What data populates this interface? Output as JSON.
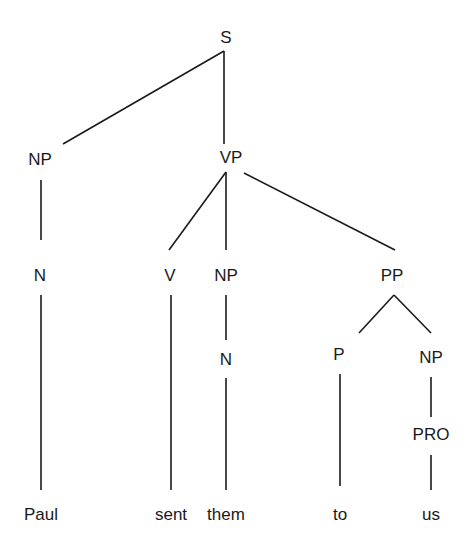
{
  "diagram": {
    "type": "syntax-tree",
    "sentence": "Paul sent them to us",
    "nodes": {
      "s": {
        "label": "S",
        "x": 226,
        "y": 38
      },
      "np_subj": {
        "label": "NP",
        "x": 40,
        "y": 160
      },
      "vp": {
        "label": "VP",
        "x": 231,
        "y": 158
      },
      "n_subj": {
        "label": "N",
        "x": 40,
        "y": 276
      },
      "v": {
        "label": "V",
        "x": 170,
        "y": 276
      },
      "np_obj": {
        "label": "NP",
        "x": 226,
        "y": 276
      },
      "pp": {
        "label": "PP",
        "x": 392,
        "y": 276
      },
      "n_obj": {
        "label": "N",
        "x": 226,
        "y": 360
      },
      "p": {
        "label": "P",
        "x": 339,
        "y": 355
      },
      "np_pp": {
        "label": "NP",
        "x": 431,
        "y": 358
      },
      "pro": {
        "label": "PRO",
        "x": 431,
        "y": 435
      }
    },
    "leaves": [
      {
        "id": "paul",
        "label": "Paul",
        "x": 41,
        "y": 515
      },
      {
        "id": "sent",
        "label": "sent",
        "x": 171,
        "y": 515
      },
      {
        "id": "them",
        "label": "them",
        "x": 226,
        "y": 515
      },
      {
        "id": "to",
        "label": "to",
        "x": 340,
        "y": 515
      },
      {
        "id": "us",
        "label": "us",
        "x": 431,
        "y": 515
      }
    ],
    "edges": [
      {
        "from": "S",
        "to": "NP",
        "x1": 224,
        "y1": 51,
        "x2": 63,
        "y2": 144
      },
      {
        "from": "S",
        "to": "VP",
        "x1": 224,
        "y1": 51,
        "x2": 224,
        "y2": 144
      },
      {
        "from": "NP",
        "to": "N",
        "x1": 41,
        "y1": 180,
        "x2": 41,
        "y2": 240
      },
      {
        "from": "VP",
        "to": "V",
        "x1": 226,
        "y1": 172,
        "x2": 169,
        "y2": 250
      },
      {
        "from": "VP",
        "to": "NP",
        "x1": 226,
        "y1": 172,
        "x2": 226,
        "y2": 250
      },
      {
        "from": "VP",
        "to": "PP",
        "x1": 244,
        "y1": 173,
        "x2": 395,
        "y2": 250
      },
      {
        "from": "N",
        "to": "Paul",
        "x1": 41,
        "y1": 295,
        "x2": 41,
        "y2": 490
      },
      {
        "from": "V",
        "to": "sent",
        "x1": 171,
        "y1": 295,
        "x2": 171,
        "y2": 490
      },
      {
        "from": "NP",
        "to": "N",
        "x1": 226,
        "y1": 295,
        "x2": 226,
        "y2": 340
      },
      {
        "from": "N",
        "to": "them",
        "x1": 226,
        "y1": 378,
        "x2": 226,
        "y2": 490
      },
      {
        "from": "PP",
        "to": "P",
        "x1": 394,
        "y1": 295,
        "x2": 359,
        "y2": 333
      },
      {
        "from": "PP",
        "to": "NP",
        "x1": 394,
        "y1": 295,
        "x2": 431,
        "y2": 333
      },
      {
        "from": "P",
        "to": "to",
        "x1": 340,
        "y1": 374,
        "x2": 340,
        "y2": 486
      },
      {
        "from": "NP",
        "to": "PRO",
        "x1": 431,
        "y1": 377,
        "x2": 431,
        "y2": 417
      },
      {
        "from": "PRO",
        "to": "us",
        "x1": 431,
        "y1": 455,
        "x2": 431,
        "y2": 490
      }
    ],
    "line_color": "#1a1a1a",
    "text_color": "#1a1a1a",
    "background": "#ffffff"
  }
}
